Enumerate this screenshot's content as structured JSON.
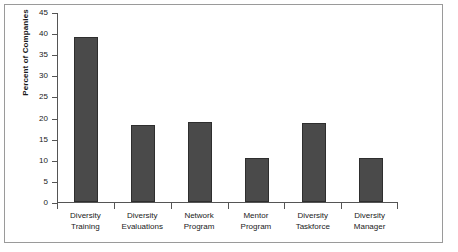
{
  "chart_data": {
    "type": "bar",
    "title": "",
    "subtitle": "",
    "xlabel": "",
    "ylabel": "Percent of Companies",
    "ylim": [
      0,
      45
    ],
    "yticks": [
      0,
      5,
      10,
      15,
      20,
      25,
      30,
      35,
      40,
      45
    ],
    "ytick_labels": [
      "0",
      "5",
      "10",
      "15",
      "20",
      "25",
      "30",
      "35",
      "40",
      "45"
    ],
    "grid": false,
    "legend": false,
    "legend_position": "none",
    "bar_color": "#4a4a4a",
    "bar_edge_color": "#2e2e2e",
    "background_color": "#ffffff",
    "axis_color": "#555555",
    "frame_color": "#9a9a9a",
    "categories": [
      "Diversity Training",
      "Diversity Evaluations",
      "Network Program",
      "Mentor Program",
      "Diversity Taskforce",
      "Diversity Manager"
    ],
    "category_lines": [
      [
        "Diversity",
        "Training"
      ],
      [
        "Diversity",
        "Evaluations"
      ],
      [
        "Network",
        "Program"
      ],
      [
        "Mentor",
        "Program"
      ],
      [
        "Diversity",
        "Taskforce"
      ],
      [
        "Diversity",
        "Manager"
      ]
    ],
    "values": [
      39,
      18.2,
      19,
      10.5,
      18.7,
      10.5
    ]
  }
}
